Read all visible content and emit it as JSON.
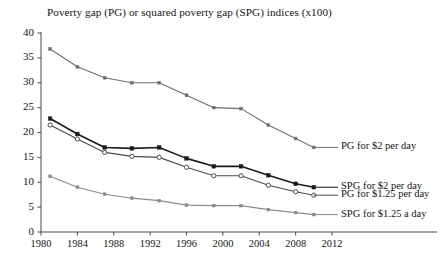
{
  "chart_data": {
    "type": "line",
    "title": "Poverty gap (PG) or squared poverty gap (SPG) indices (x100)",
    "xlabel": "",
    "ylabel": "",
    "xlim": [
      1980,
      2012
    ],
    "ylim": [
      0,
      40
    ],
    "grid": false,
    "legend_position": "right-inline-annotations",
    "xticks": [
      "1980",
      "1984",
      "1988",
      "1992",
      "1996",
      "2000",
      "2004",
      "2008",
      "2012"
    ],
    "yticks": [
      "0",
      "5",
      "10",
      "15",
      "20",
      "25",
      "30",
      "35",
      "40"
    ],
    "x": [
      1981,
      1984,
      1987,
      1990,
      1993,
      1996,
      1999,
      2002,
      2005,
      2008,
      2010
    ],
    "series": [
      {
        "name": "PG for $2 per day",
        "marker": "filled-square",
        "color": "#6e6e6e",
        "values": [
          36.8,
          33.2,
          31.0,
          30.0,
          30.0,
          27.5,
          25.0,
          24.8,
          21.5,
          18.8,
          17.0
        ]
      },
      {
        "name": "SPG for $2 per day",
        "marker": "filled-square",
        "color": "#1a1a1a",
        "values": [
          22.8,
          19.7,
          17.0,
          16.8,
          17.0,
          14.8,
          13.2,
          13.2,
          11.4,
          9.7,
          9.0
        ]
      },
      {
        "name": "PG for $1.25 per day",
        "marker": "open-circle",
        "color": "#4a4a4a",
        "values": [
          21.5,
          18.7,
          16.0,
          15.2,
          15.0,
          13.0,
          11.3,
          11.3,
          9.4,
          8.1,
          7.4
        ]
      },
      {
        "name": "SPG for $1.25 a day",
        "marker": "filled-square",
        "color": "#8a8a8a",
        "values": [
          11.2,
          9.0,
          7.6,
          6.8,
          6.3,
          5.4,
          5.3,
          5.3,
          4.5,
          3.9,
          3.5
        ]
      }
    ],
    "annotations": [
      {
        "text": "PG for $2 per day",
        "x": 2010,
        "y": 17.0
      },
      {
        "text": "SPG for $2 per day",
        "x": 2010,
        "y": 9.0
      },
      {
        "text": "PG for $1.25 per day",
        "x": 2010,
        "y": 7.4
      },
      {
        "text": "SPG for $1.25 a day",
        "x": 2010,
        "y": 3.5
      }
    ]
  }
}
